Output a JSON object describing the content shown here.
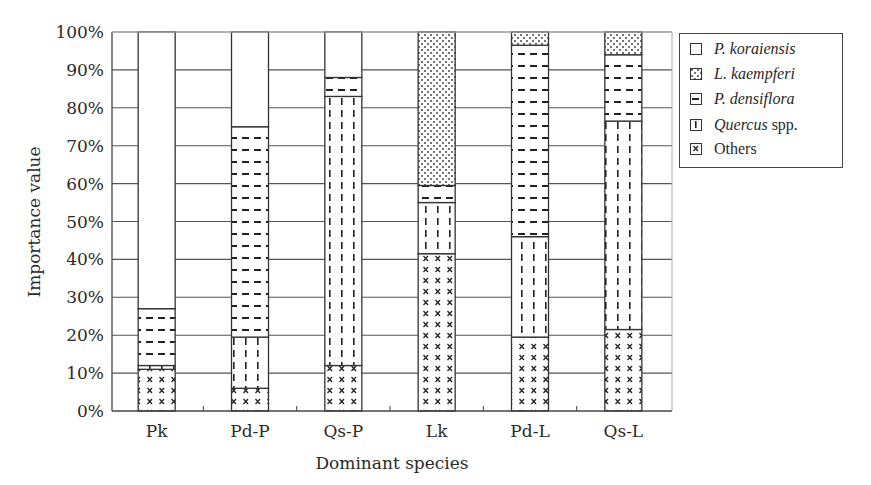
{
  "chart_data": {
    "type": "bar",
    "stacked": true,
    "title": "",
    "xlabel": "Dominant species",
    "ylabel": "Importance value",
    "ylim": [
      0,
      100
    ],
    "y_ticks": [
      "0%",
      "10%",
      "20%",
      "30%",
      "40%",
      "50%",
      "60%",
      "70%",
      "80%",
      "90%",
      "100%"
    ],
    "grid": "horizontal",
    "legend_position": "right-top",
    "categories": [
      "Pk",
      "Pd-P",
      "Qs-P",
      "Lk",
      "Pd-L",
      "Qs-L"
    ],
    "series": [
      {
        "name": "Others",
        "pattern": "x-marks",
        "values": [
          11,
          6,
          12,
          41.5,
          19.5,
          21.5
        ]
      },
      {
        "name": "Quercus spp.",
        "pattern": "vertical-dashes",
        "values": [
          1,
          13.5,
          71,
          13.5,
          26.5,
          55
        ]
      },
      {
        "name": "P. densiflora",
        "pattern": "horizontal-dashes",
        "values": [
          15,
          55.5,
          5,
          4.5,
          50.5,
          17.5
        ]
      },
      {
        "name": "L. kaempferi",
        "pattern": "dots",
        "values": [
          0,
          0,
          0,
          40.5,
          3.5,
          6
        ]
      },
      {
        "name": "P. koraiensis",
        "pattern": "blank",
        "values": [
          73,
          25,
          12,
          0,
          0,
          0
        ]
      }
    ]
  },
  "legend": {
    "items": [
      {
        "label_italic": "P. koraiensis",
        "label_plain": "",
        "pattern": "blank"
      },
      {
        "label_italic": "L. kaempferi",
        "label_plain": "",
        "pattern": "dots"
      },
      {
        "label_italic": "P. densiflora",
        "label_plain": "",
        "pattern": "horizontal-dashes"
      },
      {
        "label_italic": "Quercus",
        "label_plain": " spp.",
        "pattern": "vertical-dashes"
      },
      {
        "label_italic": "",
        "label_plain": "Others",
        "pattern": "x-marks"
      }
    ]
  },
  "axes": {
    "x_title": "Dominant species",
    "y_title": "Importance value"
  }
}
